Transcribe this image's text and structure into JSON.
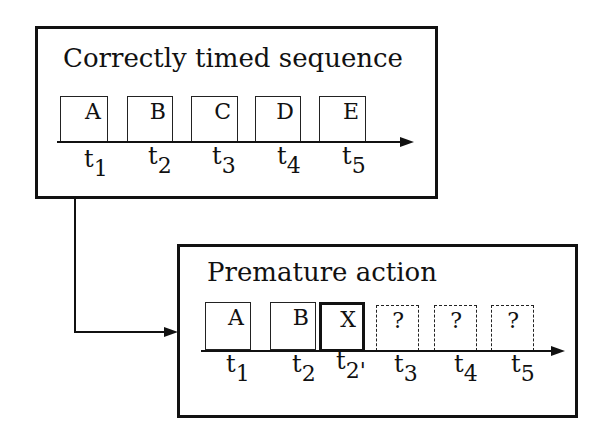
{
  "top_panel": {
    "title": "Correctly timed sequence",
    "cells": [
      {
        "label": "A",
        "time": "t",
        "sub": "1"
      },
      {
        "label": "B",
        "time": "t",
        "sub": "2"
      },
      {
        "label": "C",
        "time": "t",
        "sub": "3"
      },
      {
        "label": "D",
        "time": "t",
        "sub": "4"
      },
      {
        "label": "E",
        "time": "t",
        "sub": "5"
      }
    ]
  },
  "bottom_panel": {
    "title": "Premature action",
    "cells": [
      {
        "label": "A",
        "time": "t",
        "sub": "1",
        "style": "solid"
      },
      {
        "label": "B",
        "time": "t",
        "sub": "2",
        "style": "solid"
      },
      {
        "label": "X",
        "time": "t",
        "sub": "2'",
        "style": "bold"
      },
      {
        "label": "?",
        "time": "t",
        "sub": "3",
        "style": "dashed"
      },
      {
        "label": "?",
        "time": "t",
        "sub": "4",
        "style": "dashed"
      },
      {
        "label": "?",
        "time": "t",
        "sub": "5",
        "style": "dashed"
      }
    ]
  }
}
